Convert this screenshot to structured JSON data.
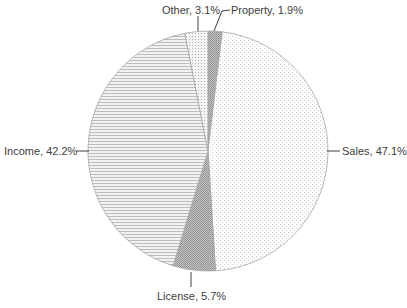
{
  "chart_data": {
    "type": "pie",
    "title": "",
    "categories": [
      "Property",
      "Sales",
      "License",
      "Income",
      "Other"
    ],
    "values": [
      1.9,
      47.1,
      5.7,
      42.2,
      3.1
    ],
    "labels": [
      "Property, 1.9%",
      "Sales, 47.1%",
      "License, 5.7%",
      "Income, 42.2%",
      "Other, 3.1%"
    ],
    "start_angle_deg": 0,
    "direction": "clockwise",
    "legend": "none",
    "fills": [
      "dense-dots-gray",
      "sparse-dots-light",
      "dense-dots-gray",
      "horizontal-lines",
      "sparse-dots"
    ]
  },
  "labels": {
    "property": "Property, 1.9%",
    "sales": "Sales, 47.1%",
    "license": "License, 5.7%",
    "income": "Income, 42.2%",
    "other": "Other, 3.1%"
  }
}
